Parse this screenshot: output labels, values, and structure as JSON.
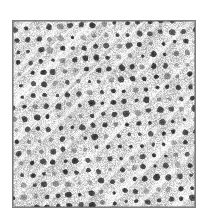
{
  "figure": {
    "kind": "micrograph-texture",
    "canvas": {
      "width": 209,
      "height": 218,
      "background": "#ffffff"
    },
    "panel": {
      "x": 12,
      "y": 20,
      "width": 184,
      "height": 188,
      "border_color": "#7d7d7d",
      "border_width": 1
    },
    "caption": "",
    "labels": [],
    "annotations": []
  },
  "texture": {
    "description": "grayscale porous lattice with diagonal bright ridges",
    "background_mean_gray": "#d9d9d9",
    "background_light": "#f2f2f2",
    "background_dark": "#b4b4b4",
    "pore_color": "#2b2b2b",
    "pore_color_soft": "#4f4f4f",
    "pore_radius_px": 2.7,
    "lattice_pitch_px": 11.2,
    "lattice_rotation_deg": -3.5,
    "lattice_shear": 0.06,
    "jitter_px": 1.15,
    "pore_radius_jitter_px": 0.85,
    "streaks": {
      "angle_deg": -45,
      "count": 11,
      "spacing_px": 23,
      "width_px": 5.5,
      "highlight": "#ffffff",
      "shadow": "#9a9a9a",
      "opacity": 0.55
    },
    "speckle": {
      "density": 0.55,
      "amplitude": 34
    },
    "seed": 20250517
  }
}
